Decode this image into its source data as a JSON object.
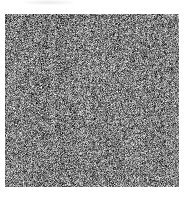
{
  "image": {
    "description": "grayscale random noise texture square on white background",
    "background_color": "#ffffff",
    "noise": {
      "x": 5,
      "y": 14,
      "width": 174,
      "height": 173,
      "grain_size_px": 1,
      "gray_min": 28,
      "gray_max": 228,
      "column_streak_strength": 16,
      "column_streak_smoothing": 2,
      "seed": 1337
    },
    "artifacts": [
      {
        "name": "faint-smudge",
        "x": 24,
        "y": 0,
        "width": 50,
        "height": 5,
        "color": "#c8c8c8"
      }
    ]
  }
}
